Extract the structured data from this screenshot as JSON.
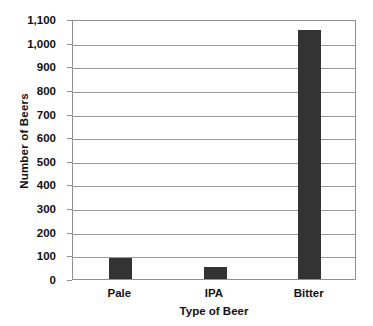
{
  "chart_data": {
    "type": "bar",
    "title": "",
    "subtitle": "",
    "categories": [
      "Pale",
      "IPA",
      "Bitter"
    ],
    "values": [
      90,
      50,
      1055
    ],
    "xlabel": "Type of Beer",
    "ylabel": "Number of Beers",
    "ylim": [
      0,
      1100
    ],
    "ytick_step": 100,
    "yticks": [
      0,
      100,
      200,
      300,
      400,
      500,
      600,
      700,
      800,
      900,
      1000,
      1100
    ],
    "ytick_labels": [
      "0",
      "100",
      "200",
      "300",
      "400",
      "500",
      "600",
      "700",
      "800",
      "900",
      "1,000",
      "1,100"
    ],
    "grid": true,
    "grid_axis": "y",
    "legend": false,
    "legend_position": "none",
    "bar_color": "#333333",
    "grid_color": "#9a9a9a",
    "axis_color": "#8f8f8f",
    "background_color": "#ffffff",
    "text_color": "#111111",
    "annotations": []
  }
}
